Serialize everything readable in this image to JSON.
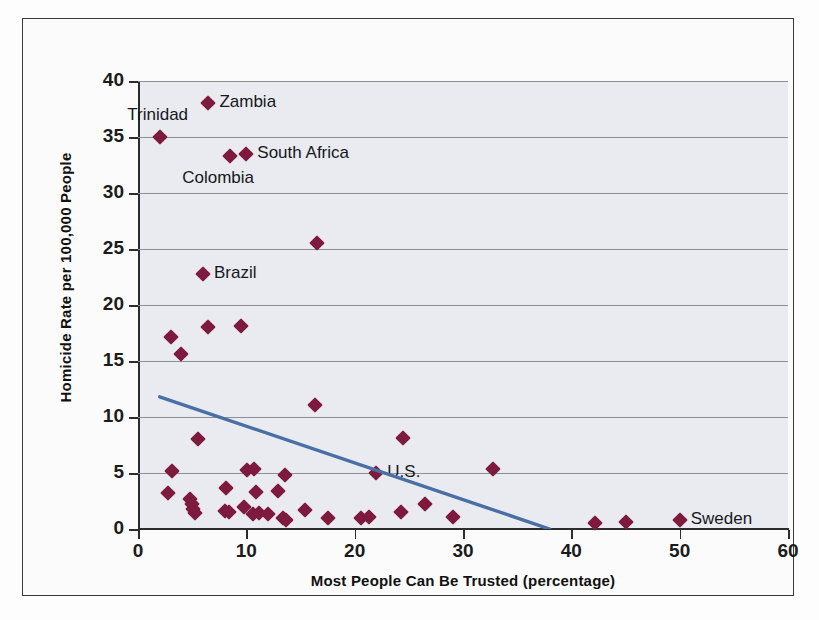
{
  "chart_data": {
    "type": "scatter",
    "title": "",
    "xlabel": "Most People Can Be Trusted (percentage)",
    "ylabel": "Homicide Rate per 100,000 People",
    "xlim": [
      0,
      60
    ],
    "ylim": [
      0,
      40
    ],
    "xticks": [
      0,
      10,
      20,
      30,
      40,
      50,
      60
    ],
    "yticks": [
      0,
      5,
      10,
      15,
      20,
      25,
      30,
      35,
      40
    ],
    "grid": "horizontal",
    "legend": "none",
    "marker_color": "#7d1a3d",
    "marker_shape": "diamond",
    "plot_background": "#e9ebf0",
    "trendline": {
      "color": "#4a6fa5",
      "x_start": 2.0,
      "y_start": 11.8,
      "x_end": 38.0,
      "y_end": 0.0
    },
    "points": [
      {
        "x": 2.0,
        "y": 35.0,
        "label": "Trinidad",
        "label_pos": "above-left"
      },
      {
        "x": 6.5,
        "y": 38.0,
        "label": "Zambia",
        "label_pos": "right"
      },
      {
        "x": 8.5,
        "y": 33.3,
        "label": "Colombia",
        "label_pos": "below-left"
      },
      {
        "x": 10.0,
        "y": 33.5,
        "label": "South Africa",
        "label_pos": "right"
      },
      {
        "x": 16.5,
        "y": 25.5,
        "label": "",
        "label_pos": ""
      },
      {
        "x": 6.0,
        "y": 22.8,
        "label": "Brazil",
        "label_pos": "right"
      },
      {
        "x": 3.0,
        "y": 17.1,
        "label": "",
        "label_pos": ""
      },
      {
        "x": 4.0,
        "y": 15.6,
        "label": "",
        "label_pos": ""
      },
      {
        "x": 6.5,
        "y": 18.0,
        "label": "",
        "label_pos": ""
      },
      {
        "x": 9.5,
        "y": 18.1,
        "label": "",
        "label_pos": ""
      },
      {
        "x": 16.3,
        "y": 11.1,
        "label": "",
        "label_pos": ""
      },
      {
        "x": 24.5,
        "y": 8.1,
        "label": "",
        "label_pos": ""
      },
      {
        "x": 5.5,
        "y": 8.0,
        "label": "",
        "label_pos": ""
      },
      {
        "x": 22.0,
        "y": 5.0,
        "label": "U.S.",
        "label_pos": "right"
      },
      {
        "x": 32.8,
        "y": 5.4,
        "label": "",
        "label_pos": ""
      },
      {
        "x": 3.1,
        "y": 5.2,
        "label": "",
        "label_pos": ""
      },
      {
        "x": 10.1,
        "y": 5.3,
        "label": "",
        "label_pos": ""
      },
      {
        "x": 10.7,
        "y": 5.4,
        "label": "",
        "label_pos": ""
      },
      {
        "x": 13.6,
        "y": 4.8,
        "label": "",
        "label_pos": ""
      },
      {
        "x": 2.8,
        "y": 3.2,
        "label": "",
        "label_pos": ""
      },
      {
        "x": 8.1,
        "y": 3.7,
        "label": "",
        "label_pos": ""
      },
      {
        "x": 10.9,
        "y": 3.3,
        "label": "",
        "label_pos": ""
      },
      {
        "x": 12.9,
        "y": 3.4,
        "label": "",
        "label_pos": ""
      },
      {
        "x": 4.8,
        "y": 2.7,
        "label": "",
        "label_pos": ""
      },
      {
        "x": 5.0,
        "y": 2.2,
        "label": "",
        "label_pos": ""
      },
      {
        "x": 5.1,
        "y": 1.8,
        "label": "",
        "label_pos": ""
      },
      {
        "x": 5.3,
        "y": 1.4,
        "label": "",
        "label_pos": ""
      },
      {
        "x": 8.0,
        "y": 1.6,
        "label": "",
        "label_pos": ""
      },
      {
        "x": 8.4,
        "y": 1.5,
        "label": "",
        "label_pos": ""
      },
      {
        "x": 9.8,
        "y": 2.0,
        "label": "",
        "label_pos": ""
      },
      {
        "x": 10.6,
        "y": 1.3,
        "label": "",
        "label_pos": ""
      },
      {
        "x": 11.2,
        "y": 1.4,
        "label": "",
        "label_pos": ""
      },
      {
        "x": 12.0,
        "y": 1.3,
        "label": "",
        "label_pos": ""
      },
      {
        "x": 13.4,
        "y": 1.0,
        "label": "",
        "label_pos": ""
      },
      {
        "x": 13.7,
        "y": 0.8,
        "label": "",
        "label_pos": ""
      },
      {
        "x": 15.4,
        "y": 1.7,
        "label": "",
        "label_pos": ""
      },
      {
        "x": 17.5,
        "y": 1.0,
        "label": "",
        "label_pos": ""
      },
      {
        "x": 20.6,
        "y": 1.0,
        "label": "",
        "label_pos": ""
      },
      {
        "x": 21.3,
        "y": 1.1,
        "label": "",
        "label_pos": ""
      },
      {
        "x": 24.3,
        "y": 1.5,
        "label": "",
        "label_pos": ""
      },
      {
        "x": 26.5,
        "y": 2.2,
        "label": "",
        "label_pos": ""
      },
      {
        "x": 29.1,
        "y": 1.1,
        "label": "",
        "label_pos": ""
      },
      {
        "x": 42.2,
        "y": 0.5,
        "label": "",
        "label_pos": ""
      },
      {
        "x": 45.0,
        "y": 0.6,
        "label": "",
        "label_pos": ""
      },
      {
        "x": 50.0,
        "y": 0.8,
        "label": "Sweden",
        "label_pos": "right"
      }
    ]
  }
}
